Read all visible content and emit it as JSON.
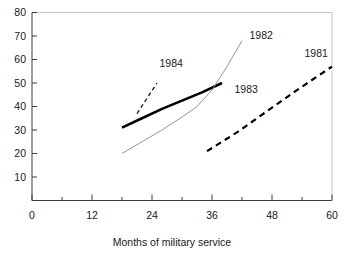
{
  "chart_data": {
    "type": "line",
    "title": "",
    "subtitle": "",
    "xlabel": "Months of military service",
    "ylabel": "",
    "xlim": [
      0,
      60
    ],
    "ylim": [
      0,
      80
    ],
    "grid": false,
    "legend_position": "inline-annotations",
    "x_ticks": [
      0,
      12,
      24,
      36,
      48,
      60
    ],
    "x_tick_labels": [
      "0",
      "12",
      "24",
      "36",
      "48",
      "60"
    ],
    "x_minor_ticks": [
      6,
      18,
      30,
      42,
      54
    ],
    "y_ticks": [
      10,
      20,
      30,
      40,
      50,
      60,
      70,
      80
    ],
    "y_tick_labels": [
      "10",
      "20",
      "30",
      "40",
      "50",
      "60",
      "70",
      "80"
    ],
    "series": [
      {
        "name": "1983",
        "label": "1983",
        "style": "solid-thick",
        "color": "#000000",
        "width": 2.6,
        "points": [
          [
            18,
            31
          ],
          [
            22,
            35
          ],
          [
            26,
            39
          ],
          [
            30,
            42.5
          ],
          [
            34,
            46
          ],
          [
            38,
            50
          ]
        ],
        "label_x": 40.5,
        "label_y": 47.5
      },
      {
        "name": "1982",
        "label": "1982",
        "style": "solid-thin",
        "color": "#8a8a8a",
        "width": 0.9,
        "points": [
          [
            18,
            20
          ],
          [
            22,
            25
          ],
          [
            26,
            30
          ],
          [
            30,
            35.5
          ],
          [
            33,
            40
          ],
          [
            36,
            47
          ],
          [
            39,
            57
          ],
          [
            42,
            68
          ]
        ],
        "label_x": 43.5,
        "label_y": 70.5
      },
      {
        "name": "1984",
        "label": "1984",
        "style": "dashed-fine",
        "color": "#1a1a1a",
        "width": 1.3,
        "points": [
          [
            21,
            37
          ],
          [
            25,
            50
          ]
        ],
        "label_x": 25.5,
        "label_y": 58.5
      },
      {
        "name": "1981",
        "label": "1981",
        "style": "dashed-bold",
        "color": "#000000",
        "width": 2.2,
        "points": [
          [
            35,
            21
          ],
          [
            41,
            29
          ],
          [
            47,
            38
          ],
          [
            53,
            47
          ],
          [
            60,
            57
          ]
        ],
        "label_x": 54.5,
        "label_y": 62.5
      }
    ]
  },
  "axis": {
    "x_title": "Months of military service"
  }
}
